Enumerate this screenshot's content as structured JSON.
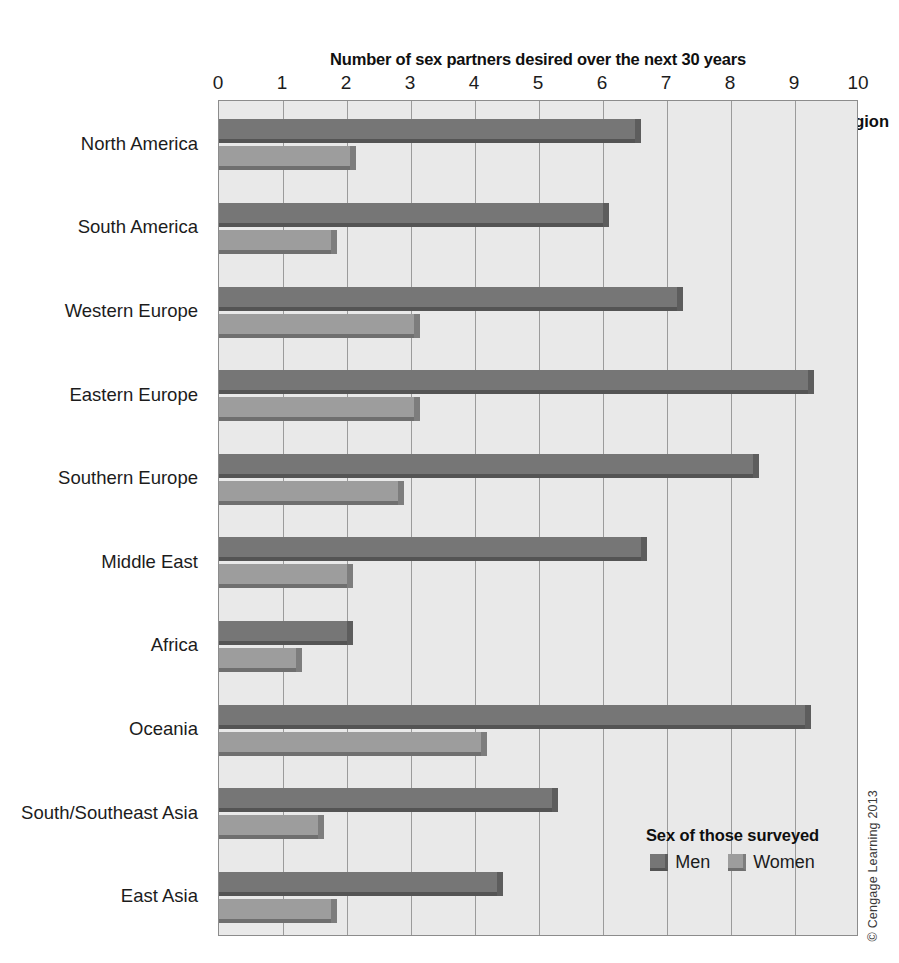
{
  "chart_data": {
    "type": "bar",
    "orientation": "horizontal",
    "title": "Number of sex partners desired over the next 30 years",
    "xlabel": "Number of sex partners desired over the next 30 years",
    "ylabel": "World region",
    "xlim": [
      0,
      10
    ],
    "xticks": [
      "0",
      "1",
      "2",
      "3",
      "4",
      "5",
      "6",
      "7",
      "8",
      "9",
      "10"
    ],
    "grid": true,
    "legend_position": "inside-bottom-right",
    "legend_title": "Sex of those surveyed",
    "categories": [
      "North America",
      "South America",
      "Western Europe",
      "Eastern Europe",
      "Southern Europe",
      "Middle East",
      "Africa",
      "Oceania",
      "South/Southeast Asia",
      "East Asia"
    ],
    "series": [
      {
        "name": "Men",
        "color": "#767676",
        "values": [
          6.5,
          6.0,
          7.15,
          9.2,
          8.35,
          6.6,
          2.0,
          9.15,
          5.2,
          4.35
        ]
      },
      {
        "name": "Women",
        "color": "#9d9d9d",
        "values": [
          2.05,
          1.75,
          3.05,
          3.05,
          2.8,
          2.0,
          1.2,
          4.1,
          1.55,
          1.75
        ]
      }
    ]
  },
  "credit": "© Cengage Learning 2013"
}
